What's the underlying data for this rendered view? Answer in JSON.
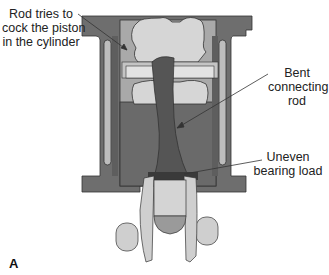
{
  "figure": {
    "panel_letter": "A",
    "labels": {
      "rod_cock": [
        "Rod tries to",
        "cock the piston",
        "in the cylinder"
      ],
      "bent_rod": [
        "Bent",
        "connecting",
        "rod"
      ],
      "uneven_load": [
        "Uneven",
        "bearing load"
      ]
    },
    "colors": {
      "cylinder": "#6e6e6e",
      "cylinder_dark": "#5a5a5a",
      "bore": "#a9a9a9",
      "piston": "#d6d6d6",
      "rod": "#555555",
      "crank": "#cfcfcf",
      "outline": "#333333",
      "leader": "#333333"
    }
  }
}
